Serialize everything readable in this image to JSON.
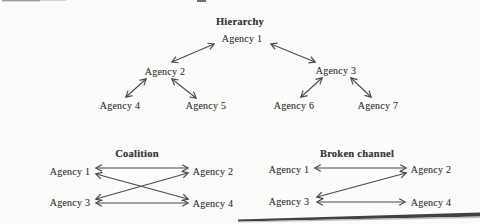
{
  "page": {
    "background": "#fbfbfa",
    "ink_color": "#4a4a4a",
    "arrow_style": "double-headed"
  },
  "diagrams": {
    "hierarchy": {
      "title": "Hierarchy",
      "nodes": {
        "a1": "Agency 1",
        "a2": "Agency 2",
        "a3": "Agency 3",
        "a4": "Agency 4",
        "a5": "Agency 5",
        "a6": "Agency 6",
        "a7": "Agency 7"
      },
      "edges": [
        {
          "from": "Agency 1",
          "to": "Agency 2",
          "style": "double-arrow"
        },
        {
          "from": "Agency 1",
          "to": "Agency 3",
          "style": "double-arrow"
        },
        {
          "from": "Agency 2",
          "to": "Agency 4",
          "style": "double-arrow"
        },
        {
          "from": "Agency 2",
          "to": "Agency 5",
          "style": "double-arrow"
        },
        {
          "from": "Agency 3",
          "to": "Agency 6",
          "style": "double-arrow"
        },
        {
          "from": "Agency 3",
          "to": "Agency 7",
          "style": "double-arrow"
        }
      ]
    },
    "coalition": {
      "title": "Coalition",
      "nodes": {
        "a1": "Agency 1",
        "a2": "Agency 2",
        "a3": "Agency 3",
        "a4": "Agency 4"
      },
      "edges": [
        {
          "from": "Agency 1",
          "to": "Agency 2",
          "style": "double-arrow"
        },
        {
          "from": "Agency 1",
          "to": "Agency 4",
          "style": "double-arrow"
        },
        {
          "from": "Agency 3",
          "to": "Agency 2",
          "style": "double-arrow"
        },
        {
          "from": "Agency 3",
          "to": "Agency 4",
          "style": "double-arrow"
        }
      ]
    },
    "broken_channel": {
      "title": "Broken channel",
      "nodes": {
        "a1": "Agency 1",
        "a2": "Agency 2",
        "a3": "Agency 3",
        "a4": "Agency 4"
      },
      "edges": [
        {
          "from": "Agency 1",
          "to": "Agency 2",
          "style": "double-arrow"
        },
        {
          "from": "Agency 2",
          "to": "Agency 3",
          "style": "double-arrow"
        },
        {
          "from": "Agency 3",
          "to": "Agency 4",
          "style": "double-arrow"
        }
      ]
    }
  }
}
